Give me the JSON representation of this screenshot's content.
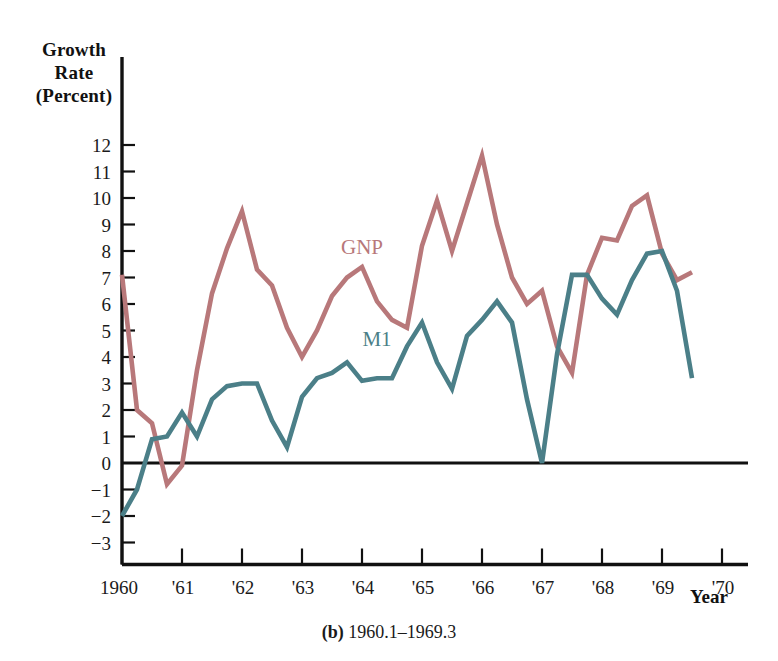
{
  "figure": {
    "caption_label": "(b)",
    "caption_text": "1960.1–1969.3"
  },
  "axes": {
    "y_title_line1": "Growth",
    "y_title_line2": "Rate",
    "y_title_line3": "(Percent)",
    "x_title": "Year",
    "y_ticks": [
      "12",
      "11",
      "10",
      "9",
      "8",
      "7",
      "6",
      "5",
      "4",
      "3",
      "2",
      "1",
      "0",
      "−1",
      "−2",
      "−3"
    ],
    "x_ticks": [
      "1960",
      "'61",
      "'62",
      "'63",
      "'64",
      "'65",
      "'66",
      "'67",
      "'68",
      "'69",
      "'70"
    ]
  },
  "series_labels": {
    "gnp": "GNP",
    "m1": "M1"
  },
  "colors": {
    "gnp": "#b8787a",
    "m1": "#4b7f88",
    "axis": "#111111",
    "text": "#1a1a1a",
    "background": "#ffffff"
  },
  "chart_data": {
    "type": "line",
    "title": "",
    "subtitle": "(b) 1960.1–1969.3",
    "xlabel": "Year",
    "ylabel": "Growth Rate (Percent)",
    "xlim": [
      1960.0,
      1970.0
    ],
    "ylim": [
      -3,
      12
    ],
    "grid": false,
    "legend": "inline-annotation",
    "x_tick_labels": [
      "1960",
      "'61",
      "'62",
      "'63",
      "'64",
      "'65",
      "'66",
      "'67",
      "'68",
      "'69",
      "'70"
    ],
    "x_tick_values": [
      1960,
      1961,
      1962,
      1963,
      1964,
      1965,
      1966,
      1967,
      1968,
      1969,
      1970
    ],
    "y_tick_values": [
      12,
      11,
      10,
      9,
      8,
      7,
      6,
      5,
      4,
      3,
      2,
      1,
      0,
      -1,
      -2,
      -3
    ],
    "x": [
      1960.0,
      1960.25,
      1960.5,
      1960.75,
      1961.0,
      1961.25,
      1961.5,
      1961.75,
      1962.0,
      1962.25,
      1962.5,
      1962.75,
      1963.0,
      1963.25,
      1963.5,
      1963.75,
      1964.0,
      1964.25,
      1964.5,
      1964.75,
      1965.0,
      1965.25,
      1965.5,
      1965.75,
      1966.0,
      1966.25,
      1966.5,
      1966.75,
      1967.0,
      1967.25,
      1967.5,
      1967.75,
      1968.0,
      1968.25,
      1968.5,
      1968.75,
      1969.0,
      1969.25,
      1969.5
    ],
    "x_quarter_labels": [
      "1960.1",
      "1960.2",
      "1960.3",
      "1960.4",
      "1961.1",
      "1961.2",
      "1961.3",
      "1961.4",
      "1962.1",
      "1962.2",
      "1962.3",
      "1962.4",
      "1963.1",
      "1963.2",
      "1963.3",
      "1963.4",
      "1964.1",
      "1964.2",
      "1964.3",
      "1964.4",
      "1965.1",
      "1965.2",
      "1965.3",
      "1965.4",
      "1966.1",
      "1966.2",
      "1966.3",
      "1966.4",
      "1967.1",
      "1967.2",
      "1967.3",
      "1967.4",
      "1968.1",
      "1968.2",
      "1968.3",
      "1968.4",
      "1969.1",
      "1969.2",
      "1969.3"
    ],
    "series": [
      {
        "name": "GNP",
        "color": "#b8787a",
        "values": [
          7.1,
          2.0,
          1.5,
          -0.8,
          -0.1,
          3.5,
          6.4,
          8.1,
          9.5,
          7.3,
          6.7,
          5.1,
          4.0,
          5.0,
          6.3,
          7.0,
          7.4,
          6.1,
          5.4,
          5.1,
          8.2,
          9.9,
          8.0,
          9.8,
          11.6,
          9.0,
          7.0,
          6.0,
          6.5,
          4.4,
          3.4,
          7.1,
          8.5,
          8.4,
          9.7,
          10.1,
          7.9,
          6.9,
          7.2
        ],
        "units": "percent"
      },
      {
        "name": "M1",
        "color": "#4b7f88",
        "values": [
          -2.0,
          -1.0,
          0.9,
          1.0,
          1.9,
          1.0,
          2.4,
          2.9,
          3.0,
          3.0,
          1.6,
          0.6,
          2.5,
          3.2,
          3.4,
          3.8,
          3.1,
          3.2,
          3.2,
          4.4,
          5.3,
          3.8,
          2.8,
          4.8,
          5.4,
          6.1,
          5.3,
          2.4,
          0.0,
          4.1,
          7.1,
          7.1,
          6.2,
          5.6,
          6.9,
          7.9,
          8.0,
          6.5,
          3.2
        ],
        "units": "percent"
      }
    ],
    "annotations": [
      {
        "text": "GNP",
        "x": 1964.0,
        "y": 7.9,
        "color": "#b8787a"
      },
      {
        "text": "M1",
        "x": 1964.25,
        "y": 4.4,
        "color": "#4b7f88"
      }
    ]
  },
  "plot_geometry": {
    "x0_px": 122,
    "y0_px": 463,
    "px_per_year": 60,
    "px_per_unit": 26.5
  }
}
